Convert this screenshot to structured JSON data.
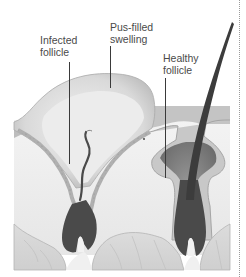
{
  "diagram": {
    "labels": {
      "infected_follicle": "Infected\nfollicle",
      "pus_filled_swelling": "Pus-filled\nswelling",
      "healthy_follicle": "Healthy\nfollicle"
    },
    "colors": {
      "background": "#ffffff",
      "swelling": "#d4d4d4",
      "epidermis": "#bdbdbd",
      "dermis": "#eeeeee",
      "follicle_bulb": "#4a4a4a",
      "hair_shaft": "#3c3c3c",
      "fat_layer": "#d8d8d8",
      "label_text": "#4a4a4a",
      "leader_line": "#3a3a3a"
    }
  }
}
